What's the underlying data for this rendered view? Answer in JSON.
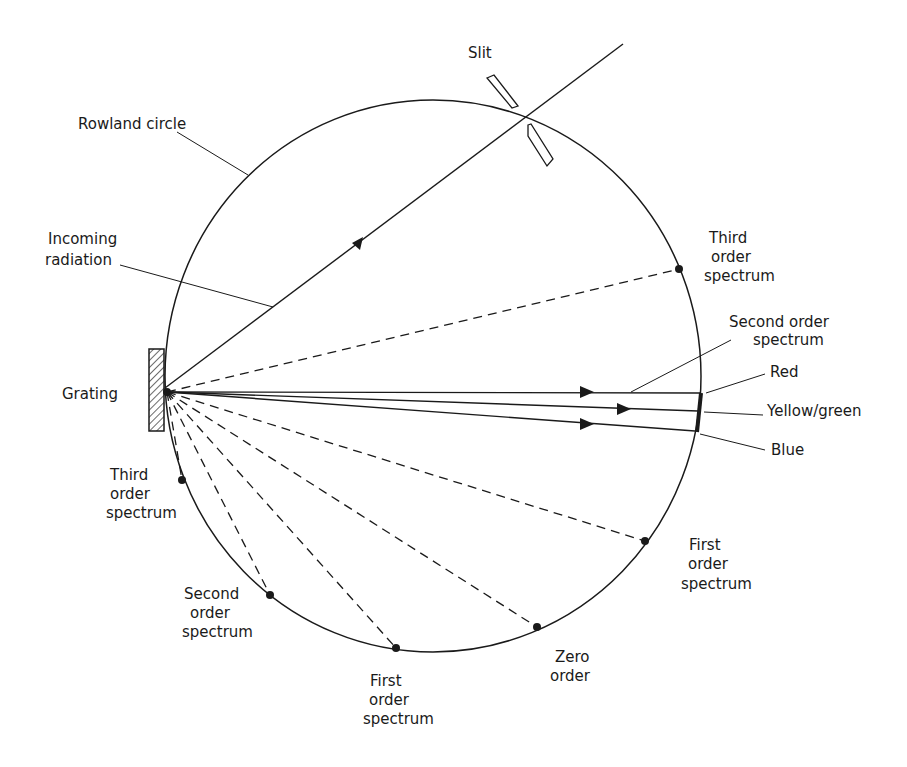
{
  "diagram": {
    "type": "Rowland circle spectrometer schematic",
    "colors": {
      "ink": "#1a1a1a",
      "background": "#ffffff"
    },
    "labels": {
      "slit": "Slit",
      "rowland_circle": "Rowland circle",
      "incoming_radiation": [
        "Incoming",
        "radiation"
      ],
      "grating": "Grating",
      "third_order_right": [
        "Third",
        "order",
        "spectrum"
      ],
      "second_order_right": [
        "Second order",
        "spectrum"
      ],
      "red": "Red",
      "yellow_green": "Yellow/green",
      "blue": "Blue",
      "first_order_right": [
        "First",
        "order",
        "spectrum"
      ],
      "zero_order": [
        "Zero",
        "order"
      ],
      "first_order_bottom": [
        "First",
        "order",
        "spectrum"
      ],
      "second_order_left": [
        "Second",
        "order",
        "spectrum"
      ],
      "third_order_left": [
        "Third",
        "order",
        "spectrum"
      ]
    }
  }
}
